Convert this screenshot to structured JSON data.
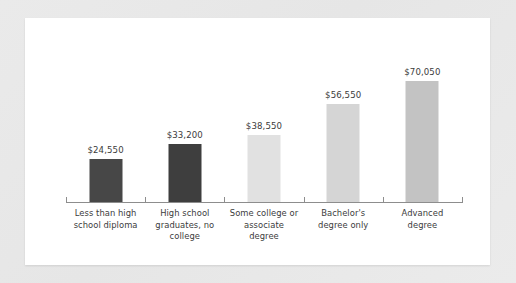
{
  "figure": {
    "panel_background": "#ffffff",
    "mat_background": "#e9e9e9",
    "axis_color": "#8d8d8d",
    "text_color": "#3b3b3b"
  },
  "chart_data": {
    "type": "bar",
    "title": "",
    "subtitle": "",
    "xlabel": "",
    "ylabel": "",
    "ylim": [
      0,
      75000
    ],
    "grid": false,
    "legend": "none",
    "value_prefix": "$",
    "categories": [
      "Less than high school diploma",
      "High school graduates, no college",
      "Some college or associate degree",
      "Bachelor's degree only",
      "Advanced degree"
    ],
    "category_lines": [
      [
        "Less than high",
        "school diploma"
      ],
      [
        "High school",
        "graduates, no",
        "college"
      ],
      [
        "Some college or",
        "associate",
        "degree"
      ],
      [
        "Bachelor's",
        "degree only"
      ],
      [
        "Advanced",
        "degree"
      ]
    ],
    "values": [
      24550,
      33200,
      38550,
      56550,
      70050
    ],
    "value_labels": [
      "$24,550",
      "$33,200",
      "$38,550",
      "$56,550",
      "$70,050"
    ],
    "bar_colors": [
      "#474747",
      "#3e3e3e",
      "#e1e1e1",
      "#d5d5d5",
      "#c3c3c3"
    ]
  }
}
